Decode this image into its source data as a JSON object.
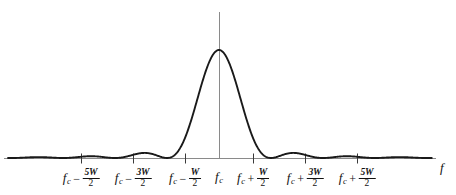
{
  "figure": {
    "type": "spectrum-plot",
    "background_color": "#ffffff",
    "curve_color": "#1a1a1a",
    "axis_color": "#808080",
    "axis_name_label": "f"
  },
  "axis": {
    "x_axis_label": "f",
    "baseline_y": 158,
    "center_x": 219,
    "tick_spacing_px": 52,
    "vertical_line_top_y": 12
  },
  "ticks": [
    {
      "id": "tick-minus-5w-over-2",
      "x": 81,
      "base": "f",
      "subscript": "c",
      "operator": "−",
      "numerator": "5W",
      "denominator": "2",
      "value": -2.5
    },
    {
      "id": "tick-minus-3w-over-2",
      "x": 133,
      "base": "f",
      "subscript": "c",
      "operator": "−",
      "numerator": "3W",
      "denominator": "2",
      "value": -1.5
    },
    {
      "id": "tick-minus-w-over-2",
      "x": 185,
      "base": "f",
      "subscript": "c",
      "operator": "−",
      "numerator": "W",
      "denominator": "2",
      "value": -0.5
    },
    {
      "id": "tick-center-fc",
      "x": 219,
      "base": "f",
      "subscript": "c",
      "operator": "",
      "numerator": "",
      "denominator": "",
      "value": 0
    },
    {
      "id": "tick-plus-w-over-2",
      "x": 253,
      "base": "f",
      "subscript": "c",
      "operator": "+",
      "numerator": "W",
      "denominator": "2",
      "value": 0.5
    },
    {
      "id": "tick-plus-3w-over-2",
      "x": 305,
      "base": "f",
      "subscript": "c",
      "operator": "+",
      "numerator": "3W",
      "denominator": "2",
      "value": 1.5
    },
    {
      "id": "tick-plus-5w-over-2",
      "x": 357,
      "base": "f",
      "subscript": "c",
      "operator": "+",
      "numerator": "5W",
      "denominator": "2",
      "value": 2.5
    }
  ],
  "chart_data": {
    "type": "line",
    "title": "",
    "subtitle": "",
    "xlabel": "f",
    "ylabel": "",
    "grid": false,
    "legend": null,
    "annotations": [],
    "xlim": [
      -4.0,
      4.0
    ],
    "ylim": [
      0,
      1.05
    ],
    "x_tick_values": [
      -2.5,
      -1.5,
      -0.5,
      0,
      0.5,
      1.5,
      2.5
    ],
    "x_tick_labels": [
      "f_c - 5W/2",
      "f_c - 3W/2",
      "f_c - W/2",
      "f_c",
      "f_c + W/2",
      "f_c + 3W/2",
      "f_c + 5W/2"
    ],
    "function": "sinc_squared",
    "nulls": [
      -3.5,
      -2.5,
      -1.5,
      -0.5,
      0.5,
      1.5,
      2.5,
      3.5
    ],
    "main_lobe": {
      "center_x": 0,
      "peak_y": 1.0,
      "null_left": -0.5,
      "null_right": 0.5
    },
    "side_lobes": [
      {
        "center_x": -3.0,
        "peak_y": 0.045
      },
      {
        "center_x": -2.0,
        "peak_y": 0.083
      },
      {
        "center_x": -1.0,
        "peak_y": 0.225
      },
      {
        "center_x": 1.0,
        "peak_y": 0.225
      },
      {
        "center_x": 2.0,
        "peak_y": 0.083
      },
      {
        "center_x": 3.0,
        "peak_y": 0.045
      }
    ],
    "series": [
      {
        "name": "S(f)",
        "x": [
          -4.0,
          -3.9,
          -3.8,
          -3.7,
          -3.6,
          -3.5,
          -3.4,
          -3.3,
          -3.2,
          -3.1,
          -3.0,
          -2.9,
          -2.8,
          -2.7,
          -2.6,
          -2.5,
          -2.4,
          -2.3,
          -2.2,
          -2.1,
          -2.0,
          -1.9,
          -1.8,
          -1.7,
          -1.6,
          -1.5,
          -1.4,
          -1.3,
          -1.2,
          -1.1,
          -1.0,
          -0.9,
          -0.8,
          -0.7,
          -0.6,
          -0.5,
          -0.4,
          -0.3,
          -0.2,
          -0.1,
          0.0,
          0.1,
          0.2,
          0.3,
          0.4,
          0.5,
          0.6,
          0.7,
          0.8,
          0.9,
          1.0,
          1.1,
          1.2,
          1.3,
          1.4,
          1.5,
          1.6,
          1.7,
          1.8,
          1.9,
          2.0,
          2.1,
          2.2,
          2.3,
          2.4,
          2.5,
          2.6,
          2.7,
          2.8,
          2.9,
          3.0,
          3.1,
          3.2,
          3.3,
          3.4,
          3.5,
          3.6,
          3.7,
          3.8,
          3.9,
          4.0
        ],
        "y": [
          0.0,
          0.012,
          0.026,
          0.036,
          0.039,
          0.0,
          0.039,
          0.036,
          0.026,
          0.012,
          0.045,
          0.012,
          0.026,
          0.036,
          0.039,
          0.0,
          0.043,
          0.062,
          0.077,
          0.083,
          0.083,
          0.077,
          0.062,
          0.043,
          0.022,
          0.0,
          0.049,
          0.126,
          0.19,
          0.222,
          0.225,
          0.222,
          0.19,
          0.126,
          0.049,
          0.0,
          0.24,
          0.54,
          0.82,
          0.97,
          1.0,
          0.97,
          0.82,
          0.54,
          0.24,
          0.0,
          0.049,
          0.126,
          0.19,
          0.222,
          0.225,
          0.222,
          0.19,
          0.126,
          0.049,
          0.0,
          0.022,
          0.043,
          0.062,
          0.077,
          0.083,
          0.077,
          0.062,
          0.043,
          0.022,
          0.0,
          0.013,
          0.026,
          0.036,
          0.042,
          0.045,
          0.042,
          0.036,
          0.026,
          0.013,
          0.0,
          0.01,
          0.02,
          0.026,
          0.02,
          0.0
        ]
      }
    ]
  }
}
